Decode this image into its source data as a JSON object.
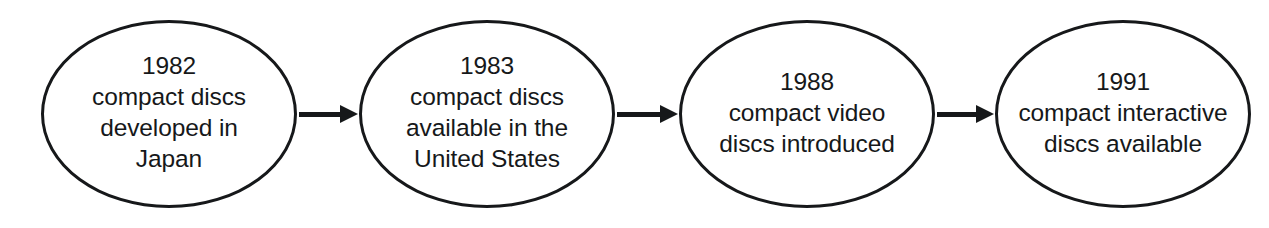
{
  "diagram": {
    "type": "flowchart",
    "orientation": "horizontal",
    "title": "",
    "shape": "ellipse",
    "colors": {
      "stroke": "#16181a",
      "fill": "#ffffff",
      "text": "#16181a",
      "background": "#ffffff"
    },
    "nodes": [
      {
        "id": "node-1982",
        "year": "1982",
        "lines": [
          "compact discs",
          "developed in",
          "Japan"
        ]
      },
      {
        "id": "node-1983",
        "year": "1983",
        "lines": [
          "compact discs",
          "available in the",
          "United States"
        ]
      },
      {
        "id": "node-1988",
        "year": "1988",
        "lines": [
          "compact video",
          "discs introduced"
        ]
      },
      {
        "id": "node-1991",
        "year": "1991",
        "lines": [
          "compact interactive",
          "discs available"
        ]
      }
    ],
    "connectors": [
      {
        "id": "arrow-1",
        "from": "node-1982",
        "to": "node-1983",
        "glyph": "arrow-right-icon"
      },
      {
        "id": "arrow-2",
        "from": "node-1983",
        "to": "node-1988",
        "glyph": "arrow-right-icon"
      },
      {
        "id": "arrow-3",
        "from": "node-1988",
        "to": "node-1991",
        "glyph": "arrow-right-icon"
      }
    ]
  }
}
